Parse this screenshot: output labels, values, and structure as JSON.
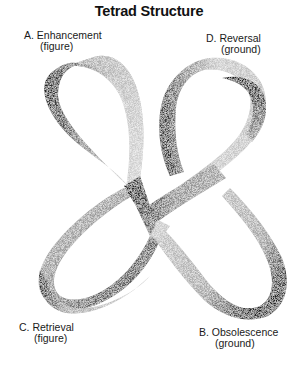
{
  "title": "Tetrad Structure",
  "labels": {
    "a": {
      "main": "A. Enhancement",
      "sub": "(figure)"
    },
    "d": {
      "main": "D. Reversal",
      "sub": "(ground)"
    },
    "c": {
      "main": "C. Retrieval",
      "sub": "(figure)"
    },
    "b": {
      "main": "B. Obsolescence",
      "sub": "(ground)"
    }
  },
  "figure": {
    "colors": {
      "background": "#ffffff",
      "ribbon_light": "#d8d8d8",
      "ribbon_mid": "#9a9a9a",
      "ribbon_dark": "#1e1e1e",
      "text": "#1a1a1a"
    }
  }
}
